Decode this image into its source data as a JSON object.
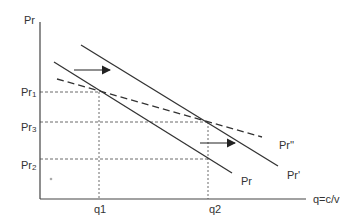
{
  "diagram": {
    "y_axis_label": "Pr",
    "x_axis_label": "q=c/v",
    "y_ticks": [
      {
        "label_main": "Pr",
        "label_sub": "1",
        "y": 92
      },
      {
        "label_main": "Pr",
        "label_sub": "3",
        "y": 122
      },
      {
        "label_main": "Pr",
        "label_sub": "2",
        "y": 159
      }
    ],
    "x_ticks": [
      {
        "label": "q1",
        "x": 99
      },
      {
        "label": "q2",
        "x": 208
      }
    ],
    "curves": [
      {
        "name": "Pr",
        "style": "solid",
        "label": "Pr"
      },
      {
        "name": "Pr'",
        "style": "solid",
        "label": "Pr'"
      },
      {
        "name": "Pr''",
        "style": "dashed",
        "label": "Pr''"
      }
    ],
    "arrows": [
      {
        "direction": "right",
        "meaning": "shift of Pr to Pr'"
      },
      {
        "direction": "right",
        "meaning": "shift of Pr to Pr'"
      }
    ],
    "colors": {
      "line": "#333333",
      "guide": "#444444"
    }
  }
}
